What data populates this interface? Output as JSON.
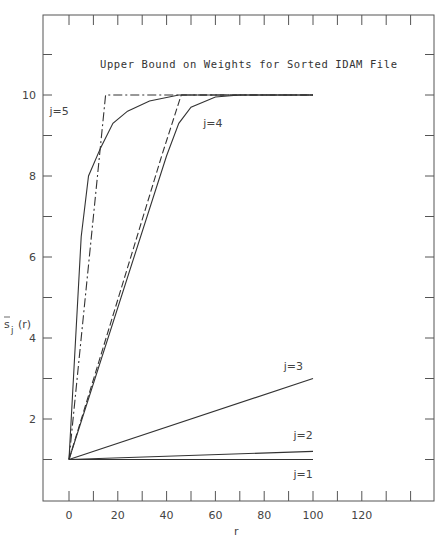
{
  "chart_data": {
    "type": "line",
    "title": "Upper Bound on Weights for Sorted IDAM File",
    "xlabel": "r",
    "ylabel": "s̄j(r)",
    "xlim": [
      -10,
      140
    ],
    "ylim": [
      -1,
      12
    ],
    "x_ticks": [
      0,
      20,
      40,
      60,
      80,
      100,
      120
    ],
    "x_tick_labels": [
      "0",
      "20",
      "40",
      "60",
      "80",
      "100",
      "120"
    ],
    "y_ticks": [
      2,
      4,
      6,
      8,
      10
    ],
    "y_tick_labels": [
      "2",
      "4",
      "6",
      "8",
      "10"
    ],
    "grid": false,
    "series": [
      {
        "name": "j=5 bound",
        "style": "dash-dot",
        "x": [
          0,
          15,
          100
        ],
        "y": [
          1,
          10,
          10
        ]
      },
      {
        "name": "j=5",
        "style": "solid",
        "x": [
          0,
          5,
          8,
          13,
          18,
          24,
          33,
          45,
          100
        ],
        "y": [
          1,
          6.5,
          8.0,
          8.7,
          9.3,
          9.6,
          9.85,
          10,
          10
        ]
      },
      {
        "name": "j=4 bound",
        "style": "dashed",
        "x": [
          0,
          38,
          46,
          100
        ],
        "y": [
          1,
          8.5,
          10,
          10
        ]
      },
      {
        "name": "j=4",
        "style": "solid",
        "x": [
          0,
          40,
          45,
          50,
          60,
          70,
          100
        ],
        "y": [
          1,
          8.5,
          9.3,
          9.7,
          9.95,
          10,
          10
        ]
      },
      {
        "name": "j=3",
        "style": "solid",
        "x": [
          0,
          100
        ],
        "y": [
          1,
          3.0
        ]
      },
      {
        "name": "j=2",
        "style": "solid",
        "x": [
          0,
          100
        ],
        "y": [
          1,
          1.2
        ]
      },
      {
        "name": "j=1",
        "style": "solid",
        "x": [
          0,
          100
        ],
        "y": [
          1,
          1.0
        ]
      }
    ],
    "annotations": [
      {
        "text": "j=5",
        "x": -8,
        "y": 9.5
      },
      {
        "text": "j=4",
        "x": 55,
        "y": 9.2
      },
      {
        "text": "j=3",
        "x": 88,
        "y": 3.2
      },
      {
        "text": "j=2",
        "x": 92,
        "y": 1.5
      },
      {
        "text": "j=1",
        "x": 92,
        "y": 0.55
      }
    ]
  }
}
